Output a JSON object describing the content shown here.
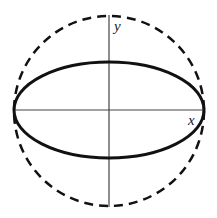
{
  "diagram": {
    "type": "geometry",
    "center": {
      "x": 109,
      "y": 110
    },
    "circle": {
      "radius": 95,
      "style": "dashed",
      "stroke": "#111111",
      "stroke_width": 2.5
    },
    "ellipse": {
      "rx": 95,
      "ry": 48,
      "style": "solid",
      "stroke": "#111111",
      "stroke_width": 3
    },
    "axes": {
      "x": {
        "label": "x",
        "from": 15,
        "to": 205
      },
      "y": {
        "label": "y",
        "from": 15,
        "to": 207
      },
      "stroke": "#444444"
    }
  }
}
